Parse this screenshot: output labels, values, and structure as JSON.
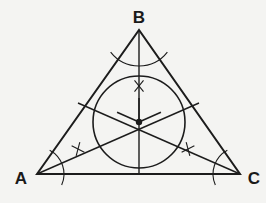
{
  "figure": {
    "background_color": "#f4f4f2",
    "stroke_color": "#1c1c1c",
    "label_color": "#1a1a1a",
    "triangle": {
      "stroke_width": 2.0,
      "vertices": [
        {
          "name": "A",
          "label": "A",
          "x": 37,
          "y": 174,
          "label_x": 21,
          "label_y": 180,
          "label_anchor": "middle"
        },
        {
          "name": "B",
          "label": "B",
          "x": 139,
          "y": 30,
          "label_x": 139,
          "label_y": 19,
          "label_anchor": "middle"
        },
        {
          "name": "C",
          "label": "C",
          "x": 240,
          "y": 174,
          "label_x": 254,
          "label_y": 180,
          "label_anchor": "middle"
        }
      ]
    },
    "incircle": {
      "center_x": 139,
      "center_y": 122,
      "radius": 46,
      "stroke_width": 1.6,
      "fill": "none"
    },
    "incenter": {
      "label": "incenter",
      "x": 139,
      "y": 122,
      "dot_radius": 3.2
    },
    "bisectors": [
      {
        "name": "bisector-from-A",
        "from": "A",
        "x1": 37,
        "y1": 174,
        "x2": 199,
        "y2": 103,
        "stroke_width": 1.4
      },
      {
        "name": "bisector-from-B",
        "from": "B",
        "x1": 139,
        "y1": 30,
        "x2": 139,
        "y2": 174,
        "stroke_width": 1.4
      },
      {
        "name": "bisector-from-C",
        "from": "C",
        "x1": 240,
        "y1": 174,
        "x2": 78,
        "y2": 103,
        "stroke_width": 1.4
      }
    ],
    "vertex_arcs": [
      {
        "name": "construction-arc-at-A",
        "cx": 37,
        "cy": 174,
        "r": 27,
        "start_deg": -62,
        "end_deg": 24,
        "stroke_width": 1.1
      },
      {
        "name": "construction-arc-at-B",
        "cx": 139,
        "cy": 30,
        "r": 36,
        "start_deg": 38,
        "end_deg": 142,
        "stroke_width": 1.1
      },
      {
        "name": "construction-arc-at-C",
        "cx": 240,
        "cy": 174,
        "r": 27,
        "start_deg": 156,
        "end_deg": 242,
        "stroke_width": 1.1
      }
    ],
    "tick_marks": [
      {
        "name": "tick-on-bisector-from-B",
        "x": 139,
        "y": 86,
        "size": 9,
        "angle_deg": 0,
        "stroke_width": 1.1
      },
      {
        "name": "tick-on-bisector-from-A",
        "x": 78,
        "y": 149,
        "size": 9,
        "angle_deg": -24,
        "stroke_width": 1.1
      },
      {
        "name": "tick-on-bisector-from-C",
        "x": 188,
        "y": 149,
        "size": 9,
        "angle_deg": 24,
        "stroke_width": 1.1
      }
    ],
    "incenter_cross": {
      "name": "incenter-cross-marks",
      "arm_length": 24,
      "stroke_width": 1.5
    }
  }
}
